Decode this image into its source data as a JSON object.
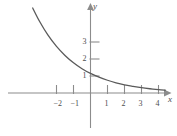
{
  "chart_data": {
    "type": "line",
    "title": "",
    "xlabel": "x",
    "ylabel": "y",
    "xlim": [
      -4.8,
      5.1
    ],
    "ylim": [
      -2.4,
      5.6
    ],
    "grid": false,
    "legend": null,
    "x_ticks": [
      -2,
      -1,
      1,
      2,
      3,
      4
    ],
    "x_tick_labels": [
      "−2",
      "−1",
      "1",
      "2",
      "3",
      "4"
    ],
    "y_ticks": [
      1,
      2,
      3
    ],
    "y_tick_labels": [
      "1",
      "2",
      "3"
    ],
    "series": [
      {
        "name": "exponential-decay",
        "description": "decreasing exponential curve passing through (0, 1)",
        "x": [
          -3.4,
          -3.0,
          -2.5,
          -2.0,
          -1.5,
          -1.0,
          -0.5,
          0.0,
          0.5,
          1.0,
          1.5,
          2.0,
          2.5,
          3.0,
          3.5,
          4.0,
          4.4
        ],
        "y": [
          5.0,
          4.22,
          3.4,
          2.74,
          2.21,
          1.78,
          1.43,
          1.15,
          0.93,
          0.75,
          0.6,
          0.48,
          0.39,
          0.31,
          0.25,
          0.2,
          0.17
        ]
      }
    ]
  },
  "colors": {
    "axis": "#8c8c8c",
    "curve": "#5a5a5a",
    "tick_text": "#4d4d4d",
    "background": "#ffffff"
  },
  "axes": {
    "x_axis_name": "x",
    "y_axis_name": "y"
  }
}
